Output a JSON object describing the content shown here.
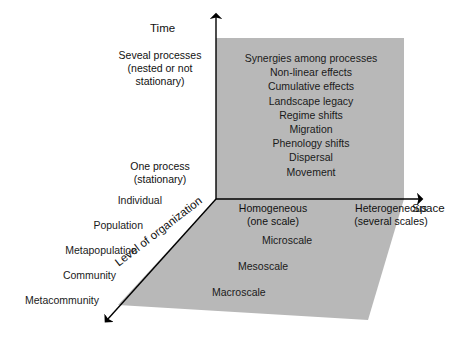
{
  "figure": {
    "type": "conceptual-3d-axes-diagram",
    "background_color": "#ffffff",
    "plane_fill_color": "#b8b8b8",
    "axis_color": "#000000",
    "text_color": "#111111"
  },
  "axes": {
    "vertical": {
      "name": "Time",
      "ticks": [
        {
          "label_line1": "Seveal processes",
          "label_line2": "(nested or not",
          "label_line3": "stationary)"
        },
        {
          "label_line1": "One process",
          "label_line2": "(stationary)"
        }
      ]
    },
    "horizontal": {
      "name": "Space",
      "ticks": [
        {
          "label_line1": "Homogeneous",
          "label_line2": "(one scale)"
        },
        {
          "label_line1": "Heterogeneous",
          "label_line2": "(several scales)"
        }
      ]
    },
    "depth": {
      "name": "Level of organization",
      "ticks": [
        {
          "label": "Individual"
        },
        {
          "label": "Population"
        },
        {
          "label": "Metapopulation"
        },
        {
          "label": "Community"
        },
        {
          "label": "Metacommunity"
        }
      ]
    }
  },
  "back_wall": {
    "processes": [
      "Synergies among processes",
      "Non-linear effects",
      "Cumulative effects",
      "Landscape legacy",
      "Regime shifts",
      "Migration",
      "Phenology shifts",
      "Dispersal",
      "Movement"
    ]
  },
  "floor": {
    "scales": [
      "Microscale",
      "Mesoscale",
      "Macroscale"
    ]
  }
}
